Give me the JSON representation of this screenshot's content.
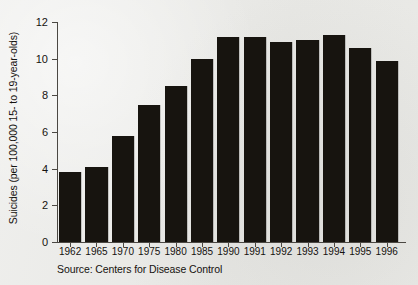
{
  "chart_data": {
    "type": "bar",
    "title": "",
    "subtitle": "",
    "xlabel": "",
    "ylabel": "Suicides (per 100,000 15- to 19-year-olds)",
    "categories": [
      "1962",
      "1965",
      "1970",
      "1975",
      "1980",
      "1985",
      "1990",
      "1991",
      "1992",
      "1993",
      "1994",
      "1995",
      "1996"
    ],
    "values": [
      3.8,
      4.1,
      5.8,
      7.5,
      8.5,
      10.0,
      11.2,
      11.2,
      10.9,
      11.0,
      11.3,
      10.6,
      9.9
    ],
    "ylim": [
      0,
      12
    ],
    "ytick_labels": [
      "0",
      "2",
      "4",
      "6",
      "8",
      "10",
      "12"
    ],
    "ytick_values": [
      0,
      2,
      4,
      6,
      8,
      10,
      12
    ],
    "grid": false,
    "legend": false,
    "legend_position": "none",
    "bar_color": "#17140f",
    "background_color": "#e9e9e6",
    "axis_color": "#4b4843",
    "annotations": [
      "Source: Centers for Disease Control"
    ]
  },
  "notes": {
    "source": "Source: Centers for Disease Control"
  }
}
